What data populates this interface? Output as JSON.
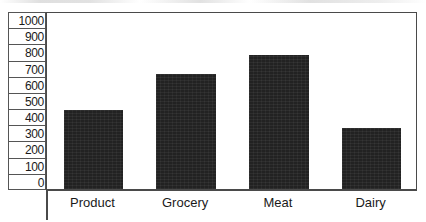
{
  "chart_data": {
    "type": "bar",
    "title": "",
    "xlabel": "",
    "ylabel": "",
    "categories": [
      "Product",
      "Grocery",
      "Meat",
      "Dairy"
    ],
    "values": [
      445,
      645,
      755,
      345
    ],
    "ylim": [
      0,
      1000
    ],
    "ytick_labels": [
      "1000",
      "900",
      "800",
      "700",
      "600",
      "500",
      "400",
      "300",
      "200",
      "100",
      "0"
    ],
    "ytick_values": [
      1000,
      900,
      800,
      700,
      600,
      500,
      400,
      300,
      200,
      100,
      0
    ],
    "ytick_step": 100,
    "grid": false,
    "legend": null,
    "bar_color": "#222222",
    "frame_color": "#4a4a4a",
    "background_color": "#ffffff"
  }
}
